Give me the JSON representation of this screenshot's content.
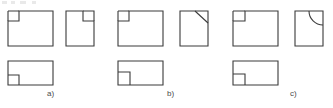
{
  "figure": {
    "width": 333,
    "height": 108,
    "background_color": "#ffffff",
    "line_color": "#3a3a3a",
    "label_color": "#4a4a4a",
    "line_width": 1.1,
    "groups": [
      {
        "id": "a",
        "label": "a)",
        "label_x": 47,
        "label_y": 92,
        "views": [
          {
            "name": "front-view",
            "shape": "rectangle-with-top-left-square-notch",
            "x": 8,
            "y": 11,
            "width": 45,
            "height": 35,
            "notch_width": 11,
            "notch_height": 10,
            "notch_corner": "top-left"
          },
          {
            "name": "side-view",
            "shape": "rectangle-with-top-right-square-notch",
            "x": 66,
            "y": 11,
            "width": 28,
            "height": 35,
            "notch_width": 11,
            "notch_height": 10,
            "notch_corner": "top-right"
          },
          {
            "name": "top-view",
            "shape": "rectangle-with-bottom-left-square-notch",
            "x": 8,
            "y": 61,
            "width": 45,
            "height": 24,
            "notch_width": 11,
            "notch_height": 10,
            "notch_corner": "bottom-left"
          }
        ]
      },
      {
        "id": "b",
        "label": "b)",
        "label_x": 167,
        "label_y": 92,
        "views": [
          {
            "name": "front-view",
            "shape": "rectangle-with-top-left-square-notch",
            "x": 118,
            "y": 11,
            "width": 45,
            "height": 35,
            "notch_width": 11,
            "notch_height": 10,
            "notch_corner": "top-left"
          },
          {
            "name": "side-view",
            "shape": "rectangle-with-top-right-chamfer",
            "x": 180,
            "y": 11,
            "width": 28,
            "height": 35,
            "chamfer_run": 13,
            "chamfer_rise": 12,
            "chamfer_corner": "top-right"
          },
          {
            "name": "top-view",
            "shape": "rectangle-with-bottom-left-square-notch",
            "x": 118,
            "y": 61,
            "width": 45,
            "height": 24,
            "notch_width": 11,
            "notch_height": 13,
            "notch_corner": "bottom-left"
          }
        ]
      },
      {
        "id": "c",
        "label": "c)",
        "label_x": 290,
        "label_y": 92,
        "views": [
          {
            "name": "front-view",
            "shape": "rectangle-with-top-left-square-notch",
            "x": 233,
            "y": 11,
            "width": 45,
            "height": 35,
            "notch_width": 11,
            "notch_height": 10,
            "notch_corner": "top-left"
          },
          {
            "name": "side-view",
            "shape": "rectangle-with-top-right-fillet-arc",
            "x": 295,
            "y": 11,
            "width": 28,
            "height": 35,
            "arc_radius": 14,
            "arc_corner": "top-right"
          },
          {
            "name": "top-view",
            "shape": "rectangle-with-bottom-left-square-notch",
            "x": 233,
            "y": 61,
            "width": 45,
            "height": 24,
            "notch_width": 11,
            "notch_height": 11,
            "notch_corner": "bottom-left"
          }
        ]
      }
    ],
    "artifacts": [
      {
        "name": "top-edge-artifact-1",
        "x": 2,
        "width": 5
      },
      {
        "name": "top-edge-artifact-2",
        "x": 11,
        "width": 4
      },
      {
        "name": "top-edge-artifact-3",
        "x": 20,
        "width": 6
      },
      {
        "name": "top-edge-artifact-4",
        "x": 32,
        "width": 4
      }
    ]
  }
}
